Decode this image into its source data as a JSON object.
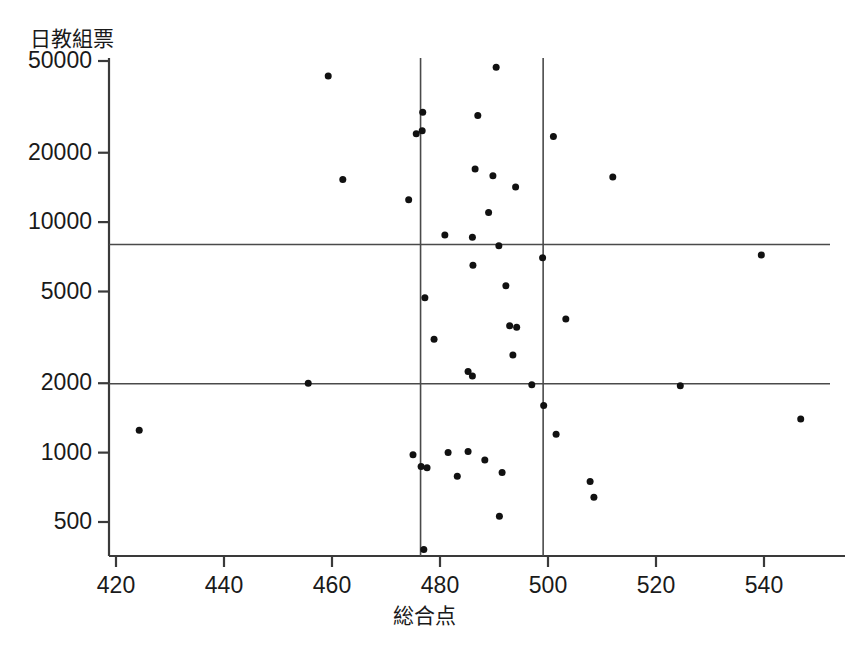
{
  "chart_data": {
    "type": "scatter",
    "title": "",
    "xlabel": "総合点",
    "ylabel": "日教組票",
    "xlim": [
      415,
      551
    ],
    "ylim": [
      400,
      56000
    ],
    "yscale": "log",
    "grid": false,
    "legend": "none",
    "xticks": [
      420,
      440,
      460,
      480,
      500,
      520,
      540
    ],
    "xtick_labels": [
      "420",
      "440",
      "460",
      "480",
      "500",
      "520",
      "540"
    ],
    "yticks": [
      500,
      1000,
      2000,
      5000,
      10000,
      20000,
      50000
    ],
    "ytick_labels": [
      "500",
      "1000",
      "2000",
      "5000",
      "10000",
      "20000",
      "50000"
    ],
    "reference_lines": {
      "vertical": [
        476.4,
        499.1
      ],
      "horizontal": [
        8000,
        1990
      ]
    },
    "marker": {
      "shape": "circle",
      "size": 7,
      "color": "#111111"
    },
    "points": [
      {
        "x": 424.3,
        "y": 1250
      },
      {
        "x": 455.6,
        "y": 2000
      },
      {
        "x": 459.3,
        "y": 43000
      },
      {
        "x": 462.0,
        "y": 15300
      },
      {
        "x": 474.2,
        "y": 12500
      },
      {
        "x": 476.8,
        "y": 30000
      },
      {
        "x": 475.6,
        "y": 24200
      },
      {
        "x": 476.7,
        "y": 24900
      },
      {
        "x": 477.2,
        "y": 4700
      },
      {
        "x": 478.9,
        "y": 3100
      },
      {
        "x": 475.0,
        "y": 980
      },
      {
        "x": 476.5,
        "y": 870
      },
      {
        "x": 477.6,
        "y": 860
      },
      {
        "x": 477.0,
        "y": 380
      },
      {
        "x": 480.9,
        "y": 8800
      },
      {
        "x": 481.5,
        "y": 1000
      },
      {
        "x": 483.2,
        "y": 790
      },
      {
        "x": 486.0,
        "y": 8600
      },
      {
        "x": 486.1,
        "y": 6500
      },
      {
        "x": 485.2,
        "y": 2250
      },
      {
        "x": 486.0,
        "y": 2150
      },
      {
        "x": 485.2,
        "y": 1010
      },
      {
        "x": 487.0,
        "y": 29000
      },
      {
        "x": 486.5,
        "y": 17000
      },
      {
        "x": 488.3,
        "y": 930
      },
      {
        "x": 489.0,
        "y": 11000
      },
      {
        "x": 489.8,
        "y": 15900
      },
      {
        "x": 490.4,
        "y": 47000
      },
      {
        "x": 490.9,
        "y": 7900
      },
      {
        "x": 491.5,
        "y": 820
      },
      {
        "x": 491.0,
        "y": 530
      },
      {
        "x": 492.2,
        "y": 5300
      },
      {
        "x": 493.5,
        "y": 2650
      },
      {
        "x": 492.9,
        "y": 3550
      },
      {
        "x": 494.2,
        "y": 3500
      },
      {
        "x": 494.0,
        "y": 14200
      },
      {
        "x": 497.0,
        "y": 1970
      },
      {
        "x": 499.0,
        "y": 7000
      },
      {
        "x": 499.2,
        "y": 1600
      },
      {
        "x": 501.0,
        "y": 23500
      },
      {
        "x": 501.5,
        "y": 1200
      },
      {
        "x": 503.3,
        "y": 3800
      },
      {
        "x": 507.8,
        "y": 750
      },
      {
        "x": 508.5,
        "y": 640
      },
      {
        "x": 512.0,
        "y": 15700
      },
      {
        "x": 524.5,
        "y": 1950
      },
      {
        "x": 539.5,
        "y": 7200
      },
      {
        "x": 546.8,
        "y": 1400
      }
    ]
  },
  "axes": {
    "y_axis_label": "日教組票",
    "x_axis_label": "総合点"
  }
}
